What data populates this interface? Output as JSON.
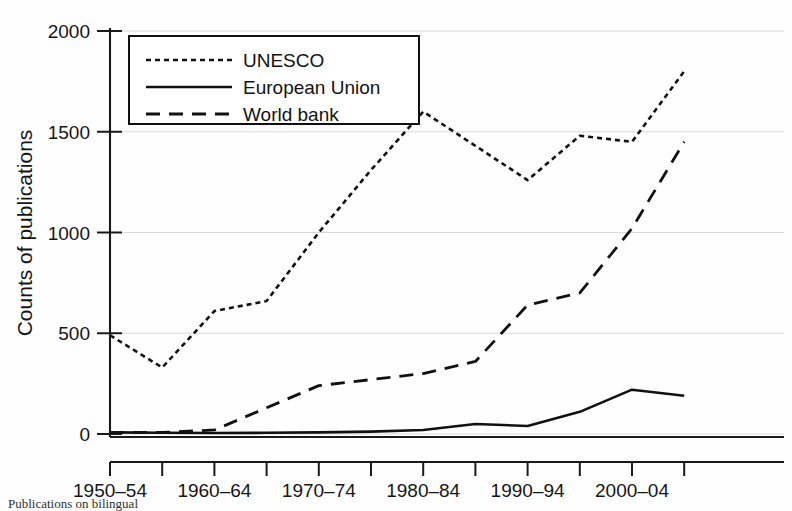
{
  "chart_data": {
    "type": "line",
    "title": "",
    "xlabel": "",
    "ylabel": "Counts of publications",
    "ylim": [
      0,
      2000
    ],
    "yticks": [
      0,
      500,
      1000,
      1500,
      2000
    ],
    "ytick_labels": [
      "0",
      "500",
      "1000",
      "1500",
      "2000"
    ],
    "grid": true,
    "grid_axis": "y",
    "legend_position": "upper-left-inside",
    "categories": [
      "1950–54",
      "1955–59",
      "1960–64",
      "1965–69",
      "1970–74",
      "1975–79",
      "1980–84",
      "1985–89",
      "1990–94",
      "1995–99",
      "2000–04",
      "2005–09"
    ],
    "xtick_labels_shown": [
      "1950–54",
      "",
      "1960–64",
      "",
      "1970–74",
      "",
      "1980–84",
      "",
      "1990–94",
      "",
      "2000–04",
      ""
    ],
    "series": [
      {
        "name": "UNESCO",
        "style": "dotted",
        "dasharray": "5,4",
        "width": 2.6,
        "values": [
          490,
          330,
          610,
          660,
          1000,
          1310,
          1600,
          1430,
          1260,
          1480,
          1450,
          1800
        ]
      },
      {
        "name": "European Union",
        "style": "solid",
        "dasharray": "",
        "width": 2.6,
        "values": [
          8,
          6,
          5,
          6,
          8,
          12,
          20,
          50,
          40,
          110,
          220,
          190
        ]
      },
      {
        "name": "World bank",
        "style": "dashed",
        "dasharray": "14,9",
        "width": 2.8,
        "values": [
          8,
          8,
          20,
          130,
          240,
          270,
          300,
          360,
          640,
          700,
          1020,
          1450
        ]
      }
    ]
  },
  "legend": {
    "entries": [
      {
        "label": "UNESCO",
        "style": "dotted"
      },
      {
        "label": "European Union",
        "style": "solid"
      },
      {
        "label": "World bank",
        "style": "dashed"
      }
    ]
  },
  "axes": {
    "y_axis_title": "Counts of publications"
  },
  "caption": {
    "text": "Publications on bilingual"
  }
}
